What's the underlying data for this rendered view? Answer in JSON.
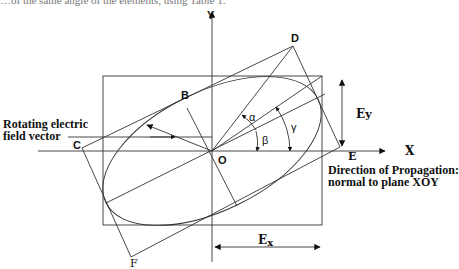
{
  "figure": {
    "type": "polarization-ellipse-diagram",
    "partial_caption_top": "…of the same angle of the elements, using Table 1.",
    "axes": {
      "x_label": "X",
      "y_label": "Y",
      "origin_label": "O"
    },
    "points": {
      "B": "B",
      "C": "C",
      "D": "D",
      "E": "E",
      "F": "F"
    },
    "angles": {
      "alpha": "α",
      "beta": "β",
      "gamma": "γ"
    },
    "components": {
      "ex": "E",
      "ex_sub": "x",
      "ey": "E",
      "ey_sub": "y"
    },
    "annotations": {
      "rotating_vector_line1": "Rotating electric",
      "rotating_vector_line2": "field vector",
      "propagation_line1": "Direction of Propagation:",
      "propagation_line2": "normal to plane XOY"
    },
    "colors": {
      "stroke": "#333333",
      "text": "#111111",
      "background": "#ffffff"
    }
  }
}
